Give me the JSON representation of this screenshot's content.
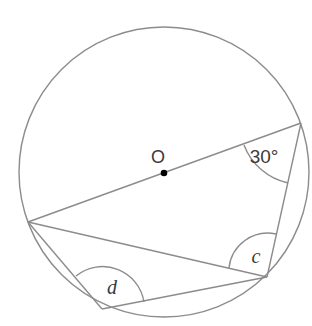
{
  "diagram": {
    "title": "",
    "colors": {
      "line": "#8c8c8c",
      "text": "#3a3a3a",
      "center_dot": "#000000",
      "background": "#ffffff"
    },
    "circle": {
      "center": [
        164,
        172
      ],
      "radius": 145,
      "center_label": "O"
    },
    "points": {
      "A": [
        28,
        222
      ],
      "B": [
        301,
        123
      ],
      "C": [
        267,
        277
      ],
      "D": [
        102,
        309
      ]
    },
    "segments": [
      [
        "A",
        "B"
      ],
      [
        "B",
        "C"
      ],
      [
        "A",
        "C"
      ],
      [
        "A",
        "D"
      ],
      [
        "D",
        "C"
      ]
    ],
    "angles": [
      {
        "at": "B",
        "label": "30°",
        "label_pos": [
          264,
          163
        ]
      },
      {
        "at": "C",
        "label": "c",
        "label_pos": [
          256,
          263
        ]
      },
      {
        "at": "D",
        "label": "d",
        "label_pos": [
          112,
          294
        ]
      }
    ]
  }
}
